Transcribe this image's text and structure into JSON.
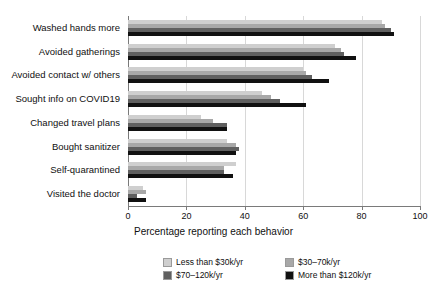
{
  "chart_data": {
    "type": "bar",
    "orientation": "horizontal",
    "grouped": true,
    "title": "",
    "xlabel": "Percentage reporting each behavior",
    "ylabel": "",
    "xlim": [
      0,
      100
    ],
    "xticks": [
      0,
      20,
      40,
      60,
      80,
      100
    ],
    "grid": "vertical",
    "legend_position": "bottom",
    "categories": [
      "Washed hands more",
      "Avoided gatherings",
      "Avoided contact w/ others",
      "Sought info on COVID19",
      "Changed travel plans",
      "Bought sanitizer",
      "Self-quarantined",
      "Visited the doctor"
    ],
    "series": [
      {
        "name": "Less than $30k/yr",
        "color": "#cfcfcf",
        "values": [
          87,
          71,
          60,
          46,
          25,
          34,
          37,
          5
        ]
      },
      {
        "name": "$30–70k/yr",
        "color": "#a8a8a8",
        "values": [
          88,
          73,
          61,
          49,
          29,
          37,
          33,
          6
        ]
      },
      {
        "name": "$70–120k/yr",
        "color": "#606060",
        "values": [
          90,
          74,
          63,
          52,
          34,
          38,
          33,
          3
        ]
      },
      {
        "name": "More than $120k/yr",
        "color": "#111111",
        "values": [
          91,
          78,
          69,
          61,
          34,
          37,
          36,
          6
        ]
      }
    ]
  },
  "legend": {
    "items": [
      {
        "label": "Less than $30k/yr",
        "color": "#cfcfcf"
      },
      {
        "label": "$30–70k/yr",
        "color": "#a8a8a8"
      },
      {
        "label": "$70–120k/yr",
        "color": "#606060"
      },
      {
        "label": "More than $120k/yr",
        "color": "#111111"
      }
    ]
  },
  "axis": {
    "x_title": "Percentage reporting each behavior",
    "x_tick_labels": [
      "0",
      "20",
      "40",
      "60",
      "80",
      "100"
    ]
  },
  "style": {
    "background": "#ffffff",
    "axis_color": "#7a7a7a",
    "grid_color": "#d8d8d8",
    "text_color": "#101010"
  }
}
